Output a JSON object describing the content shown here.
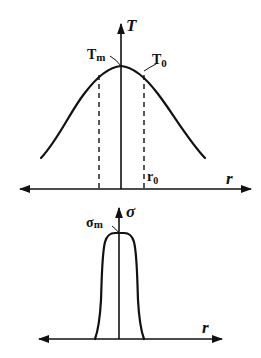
{
  "diagram": {
    "top_plot": {
      "y_axis_label": "T",
      "x_axis_label": "r",
      "peak_label_main": "T",
      "peak_label_sub": "m",
      "edge_label_main": "T",
      "edge_label_sub": "0",
      "radius_label_main": "r",
      "radius_label_sub": "0",
      "curve_shape": "bell"
    },
    "bottom_plot": {
      "y_axis_label": "σ",
      "x_axis_label": "r",
      "peak_label_main": "σ",
      "peak_label_sub": "m",
      "curve_shape": "narrow plateau"
    },
    "colors": {
      "stroke": "#111111",
      "background": "#ffffff"
    }
  }
}
